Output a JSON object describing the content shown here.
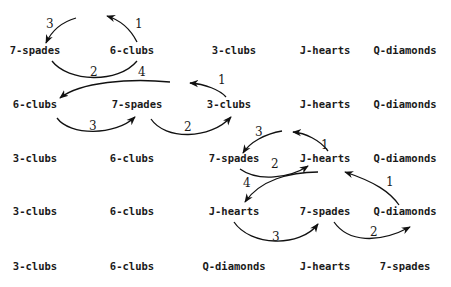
{
  "rows": [
    [
      "7-spades",
      "6-clubs",
      "3-clubs",
      "J-hearts",
      "Q-diamonds"
    ],
    [
      "6-clubs",
      "7-spades",
      "3-clubs",
      "J-hearts",
      "Q-diamonds"
    ],
    [
      "3-clubs",
      "6-clubs",
      "7-spades",
      "J-hearts",
      "Q-diamonds"
    ],
    [
      "3-clubs",
      "6-clubs",
      "J-hearts",
      "7-spades",
      "Q-diamonds"
    ],
    [
      "3-clubs",
      "6-clubs",
      "Q-diamonds",
      "J-hearts",
      "7-spades"
    ]
  ],
  "arrows": [
    {
      "label": "1",
      "from": "6-clubs",
      "row": 0
    },
    {
      "label": "3",
      "into": "7-spades",
      "row": 0
    },
    {
      "label": "2",
      "from": "7-spades",
      "row": 0
    },
    {
      "label": "4",
      "into": "6-clubs",
      "row": 1
    },
    {
      "label": "1",
      "from": "3-clubs",
      "row": 1
    },
    {
      "label": "3",
      "from": "6-clubs",
      "row": 1
    },
    {
      "label": "2",
      "from": "7-spades",
      "row": 1
    },
    {
      "label": "3",
      "into": "7-spades",
      "row": 2
    },
    {
      "label": "1",
      "from": "J-hearts",
      "row": 2
    },
    {
      "label": "2",
      "from": "7-spades",
      "row": 2
    },
    {
      "label": "4",
      "into": "J-hearts",
      "row": 3
    },
    {
      "label": "1",
      "from": "Q-diamonds",
      "row": 3
    },
    {
      "label": "3",
      "from": "J-hearts",
      "row": 3
    },
    {
      "label": "2",
      "from": "7-spades",
      "row": 3
    }
  ]
}
